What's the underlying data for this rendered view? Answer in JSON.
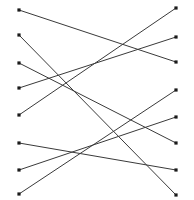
{
  "diagram": {
    "width": 194,
    "height": 200,
    "background_color": "#ffffff",
    "line_color": "#3a3a3a",
    "node_color": "#1a1a1a",
    "line_width": 1,
    "node_size": 3.2,
    "left_column_x": 19,
    "right_column_x": 176,
    "left_nodes": [
      {
        "id": "L1",
        "x": 19,
        "y": 10
      },
      {
        "id": "L2",
        "x": 19,
        "y": 35
      },
      {
        "id": "L3",
        "x": 19,
        "y": 63
      },
      {
        "id": "L4",
        "x": 19,
        "y": 88
      },
      {
        "id": "L5",
        "x": 19,
        "y": 115
      },
      {
        "id": "L6",
        "x": 19,
        "y": 143
      },
      {
        "id": "L7",
        "x": 19,
        "y": 170
      },
      {
        "id": "L8",
        "x": 19,
        "y": 194
      }
    ],
    "right_nodes": [
      {
        "id": "R1",
        "x": 176,
        "y": 8
      },
      {
        "id": "R2",
        "x": 176,
        "y": 37
      },
      {
        "id": "R3",
        "x": 176,
        "y": 62
      },
      {
        "id": "R4",
        "x": 176,
        "y": 90
      },
      {
        "id": "R5",
        "x": 176,
        "y": 117
      },
      {
        "id": "R6",
        "x": 176,
        "y": 143
      },
      {
        "id": "R7",
        "x": 176,
        "y": 170
      },
      {
        "id": "R8",
        "x": 176,
        "y": 195
      }
    ],
    "edges": [
      {
        "id": "E1",
        "from": "L1",
        "to": "R3",
        "x1": 19,
        "y1": 10,
        "x2": 176,
        "y2": 62
      },
      {
        "id": "E2",
        "from": "L2",
        "to": "R8",
        "x1": 19,
        "y1": 35,
        "x2": 176,
        "y2": 195
      },
      {
        "id": "E3",
        "from": "L3",
        "to": "R6",
        "x1": 19,
        "y1": 63,
        "x2": 176,
        "y2": 143
      },
      {
        "id": "E4",
        "from": "L4",
        "to": "R2",
        "x1": 19,
        "y1": 88,
        "x2": 176,
        "y2": 37
      },
      {
        "id": "E5",
        "from": "L5",
        "to": "R1",
        "x1": 19,
        "y1": 115,
        "x2": 176,
        "y2": 8
      },
      {
        "id": "E6",
        "from": "L6",
        "to": "R7",
        "x1": 19,
        "y1": 143,
        "x2": 176,
        "y2": 170
      },
      {
        "id": "E7",
        "from": "L7",
        "to": "R5",
        "x1": 19,
        "y1": 170,
        "x2": 176,
        "y2": 117
      },
      {
        "id": "E8",
        "from": "L8",
        "to": "R4",
        "x1": 19,
        "y1": 194,
        "x2": 176,
        "y2": 90
      }
    ]
  }
}
